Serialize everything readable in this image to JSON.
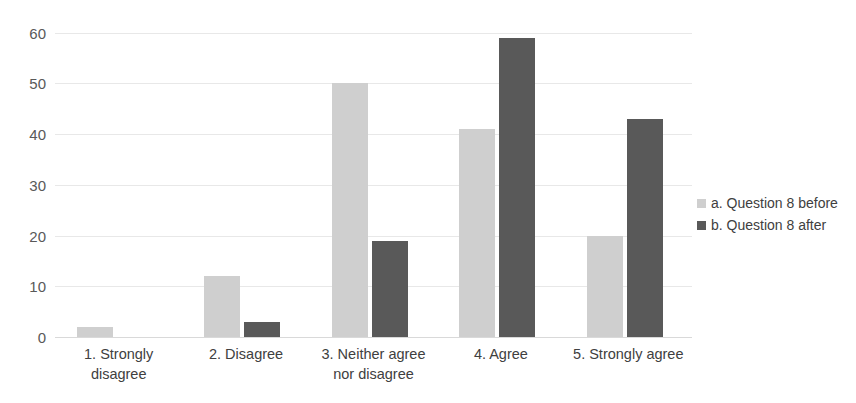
{
  "chart_data": {
    "type": "bar",
    "title": "",
    "subtitle": "",
    "xlabel": "",
    "ylabel": "",
    "ylim": [
      0,
      70
    ],
    "yticks": [
      0,
      10,
      20,
      30,
      40,
      50,
      60,
      70
    ],
    "grid": true,
    "legend_position": "right",
    "categories": [
      "1. Strongly disagree",
      "2. Disagree",
      "3. Neither agree nor disagree",
      "4. Agree",
      "5. Strongly agree"
    ],
    "category_lines": [
      [
        "1. Strongly",
        "disagree"
      ],
      [
        "2. Disagree"
      ],
      [
        "3. Neither agree",
        "nor disagree"
      ],
      [
        "4. Agree"
      ],
      [
        "5. Strongly agree"
      ]
    ],
    "series": [
      {
        "name": "a. Question 8 before",
        "color": "#cfcfcf",
        "values": [
          2,
          12,
          50,
          41,
          20
        ]
      },
      {
        "name": "b. Question 8 after",
        "color": "#595959",
        "values": [
          0,
          3,
          19,
          59,
          43
        ]
      }
    ]
  },
  "legend": {
    "items": [
      {
        "label": "a. Question 8 before",
        "color": "#cfcfcf"
      },
      {
        "label": "b. Question 8 after",
        "color": "#595959"
      }
    ]
  },
  "axis": {
    "y_tick_labels": [
      "70",
      "60",
      "50",
      "40",
      "30",
      "20",
      "10",
      "0"
    ]
  }
}
